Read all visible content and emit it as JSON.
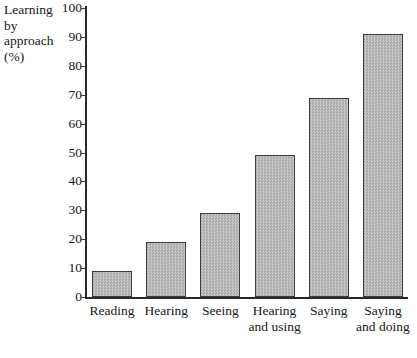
{
  "chart_data": {
    "type": "bar",
    "title": "",
    "subtitle": "",
    "xlabel": "",
    "ylabel": "Learning by approach (%)",
    "ylabel_lines": "Learning\nby\napproach\n(%)",
    "categories": [
      "Reading",
      "Hearing",
      "Seeing",
      "Hearing and using",
      "Saying",
      "Saying and doing"
    ],
    "category_lines": [
      "Reading",
      "Hearing",
      "Seeing",
      "Hearing\nand using",
      "Saying",
      "Saying\nand doing"
    ],
    "values": [
      9,
      19,
      29,
      49,
      69,
      91
    ],
    "ylim": [
      0,
      100
    ],
    "ytick_step": 10,
    "yticks": [
      0,
      10,
      20,
      30,
      40,
      50,
      60,
      70,
      80,
      90,
      100
    ],
    "ytick_labels": [
      "0",
      "10",
      "20",
      "30",
      "40",
      "50",
      "60",
      "70",
      "80",
      "90",
      "100"
    ],
    "grid": false,
    "legend": false,
    "legend_position": "none",
    "bar_fill_color": "#b9b9b9",
    "bar_border_color": "#3b3b3b",
    "axis_color": "#2a2a2a",
    "background_color": "#ffffff",
    "text_color": "#171717"
  }
}
